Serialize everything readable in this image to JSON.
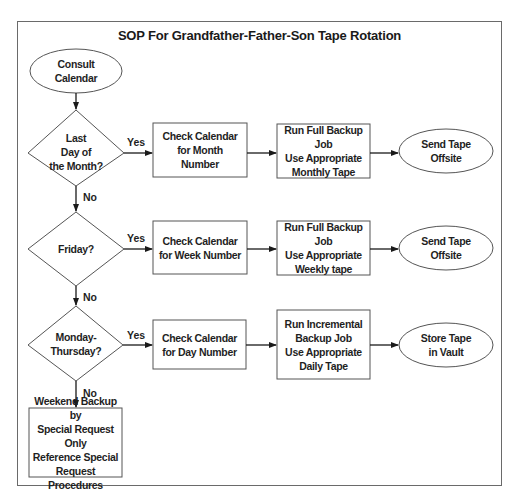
{
  "title": "SOP For Grandfather-Father-Son Tape Rotation",
  "nodes": {
    "start": "Consult\nCalendar",
    "decision_month": "Last\nDay of\nthe Month?",
    "decision_friday": "Friday?",
    "decision_weekday": "Monday-\nThursday?",
    "check_month": "Check Calendar\nfor Month\nNumber",
    "check_week": "Check Calendar\nfor Week Number",
    "check_day": "Check Calendar\nfor Day Number",
    "run_monthly": "Run Full Backup Job\nUse Appropriate\nMonthly Tape",
    "run_weekly": "Run Full Backup Job\nUse Appropriate\nWeekly tape",
    "run_daily": "Run Incremental\nBackup Job\nUse Appropriate\nDaily Tape",
    "end_monthly": "Send Tape\nOffsite",
    "end_weekly": "Send Tape\nOffsite",
    "end_daily": "Store Tape\nin Vault",
    "weekend": "Weekend Backup by\nSpecial Request Only\nReference Special\nRequest Procedures"
  },
  "edge_labels": {
    "month_yes": "Yes",
    "month_no": "No",
    "friday_yes": "Yes",
    "friday_no": "No",
    "weekday_yes": "Yes",
    "weekday_no": "No"
  },
  "colors": {
    "stroke": "#4a4a4a",
    "arrow": "#1a1a1a",
    "text": "#1f1f1f",
    "background": "#ffffff"
  }
}
